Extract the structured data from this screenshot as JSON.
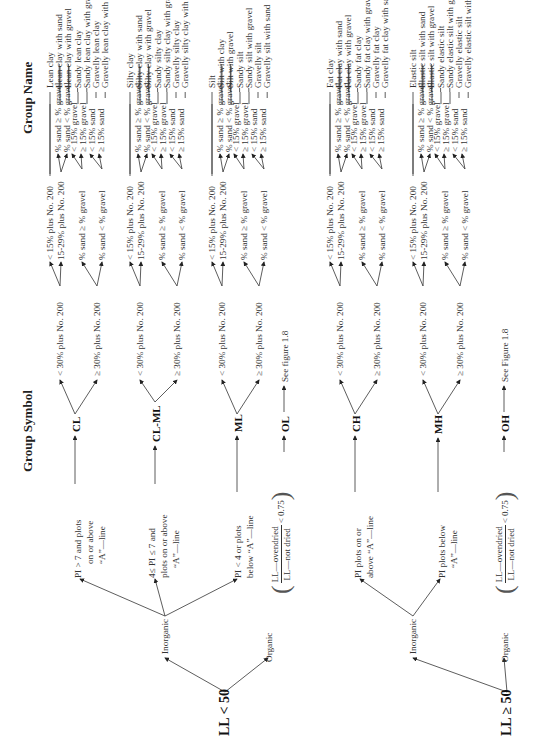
{
  "headers": {
    "group_symbol": "Group Symbol",
    "group_name": "Group Name"
  },
  "branches": [
    {
      "root": "LL < 50",
      "inorganic": "Inorganic",
      "organic": "Organic",
      "organic_ratio": {
        "numerator": "LL—ovendried",
        "denominator": "LL—not dried",
        "comparison": "< 0.75"
      },
      "conditions": [
        {
          "lines": [
            "PI > 7 and plots",
            "on or above",
            "“A”—line"
          ],
          "symbol": "CL"
        },
        {
          "lines": [
            "4≤ PI ≤ 7 and",
            "plots on or above",
            "“A”—line"
          ],
          "symbol": "CL-ML"
        },
        {
          "lines": [
            "PI < 4 or plots",
            "below “A”—line"
          ],
          "symbol": "ML"
        }
      ],
      "organic_symbol": "OL",
      "organic_ref": "See figure 1.8"
    },
    {
      "root": "LL ≥ 50",
      "inorganic": "Inorganic",
      "organic": "Organic",
      "organic_ratio": {
        "numerator": "LL—ovendried",
        "denominator": "LL—not dried",
        "comparison": "< 0.75"
      },
      "conditions": [
        {
          "lines": [
            "PI plots on or",
            "above “A”—line"
          ],
          "symbol": "CH"
        },
        {
          "lines": [
            "PI plots below",
            "“A”—line"
          ],
          "symbol": "MH"
        }
      ],
      "organic_symbol": "OH",
      "organic_ref": "See Figure 1.8"
    }
  ],
  "criteria": {
    "fines_lt30": "< 30% plus No. 200",
    "fines_ge30": "≥ 30% plus No. 200",
    "lt15": "< 15% plus No. 200",
    "r15_29": "15-29% plus No. 200",
    "sand_ge_gravel": "% sand ≥ % gravel",
    "sand_lt_gravel": "% sand < % gravel",
    "sand_ge_gravel_short": "% sand ≥ % gravel",
    "sand_lt_gravel_short": "% sand < % gravel",
    "lt15_gravel": "< 15% gravel",
    "ge15_gravel": "≥ 15% gravel",
    "lt15_sand": "< 15% sand",
    "ge15_sand": "≥ 15% sand"
  },
  "groups": [
    {
      "symbol": "CL",
      "names": [
        "Lean clay",
        "Lean clay with sand",
        "Lean clay with gravel",
        "Sandy lean clay",
        "Sandy lean clay with gravel",
        "Gravelly lean clay",
        "Gravelly lean clay with sand"
      ]
    },
    {
      "symbol": "CL-ML",
      "names": [
        "Silty clay",
        "Silty clay with sand",
        "Silty clay with gravel",
        "Sandy silty clay",
        "Sandy silty clay with gravel",
        "Gravelly silty clay",
        "Gravelly silty clay with sand"
      ]
    },
    {
      "symbol": "ML",
      "names": [
        "Silt",
        "Silt with clay",
        "Silt with gravel",
        "Sandy silt",
        "Sandy silt with gravel",
        "Gravelly silt",
        "Gravelly silt with sand"
      ]
    },
    {
      "symbol": "CH",
      "names": [
        "Fat clay",
        "Fat clay with sand",
        "Fat clay with gravel",
        "Sandy fat clay",
        "Sandy fat clay with gravel",
        "Gravelly fat clay",
        "Gravelly fat clay with sand"
      ]
    },
    {
      "symbol": "MH",
      "names": [
        "Elastic silt",
        "Elastic silt with sand",
        "Elastic silt with gravel",
        "Sandy elastic silt",
        "Sandy elastic silt with gravel",
        "Gravelly elastic silt",
        "Gravelly elastic silt with sand"
      ]
    }
  ]
}
